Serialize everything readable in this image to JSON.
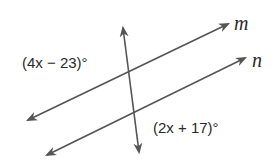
{
  "diagram": {
    "lines": [
      {
        "name": "m",
        "from": [
          28,
          120
        ],
        "to": [
          228,
          24
        ]
      },
      {
        "name": "n",
        "from": [
          47,
          155
        ],
        "to": [
          245,
          58
        ]
      },
      {
        "name": "transversal",
        "from": [
          123,
          26
        ],
        "to": [
          140,
          150
        ]
      }
    ],
    "line_labels": {
      "m": "m",
      "n": "n"
    },
    "angle_labels": {
      "upper_left": "(4x − 23)°",
      "lower_right": "(2x + 17)°"
    },
    "colors": {
      "stroke": "#555555",
      "text": "#2a2a2a",
      "background": "#ffffff"
    }
  }
}
